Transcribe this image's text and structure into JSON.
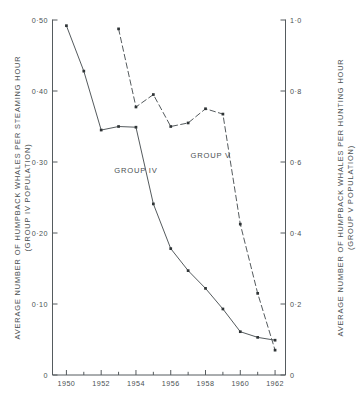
{
  "figure": {
    "background": "#ffffff",
    "ink_color": "#4b5154",
    "marker_color": "#2f3436"
  },
  "axes": {
    "left": {
      "title_line1": "AVERAGE NUMBER OF HUMPBACK WHALES PER STEAMING HOUR",
      "title_line2": "(GROUP IV POPULATION)",
      "ticks": [
        "0",
        "0·10",
        "0·20",
        "0·30",
        "0·40",
        "0·50"
      ],
      "tick_values": [
        0,
        0.1,
        0.2,
        0.3,
        0.4,
        0.5
      ],
      "range": [
        0,
        0.5
      ]
    },
    "right": {
      "title_line1": "AVERAGE NUMBER OF HUMPBACK WHALES PER HUNTING HOUR",
      "title_line2": "(GROUP V POPULATION)",
      "ticks": [
        "0",
        "0·2",
        "0·4",
        "0·6",
        "0·8",
        "1·0"
      ],
      "tick_values": [
        0,
        0.2,
        0.4,
        0.6,
        0.8,
        1.0
      ],
      "range": [
        0,
        1.0
      ]
    },
    "bottom": {
      "ticks": [
        "1950",
        "1952",
        "1954",
        "1956",
        "1958",
        "1960",
        "1962"
      ],
      "tick_values": [
        1950,
        1952,
        1954,
        1956,
        1958,
        1960,
        1962
      ],
      "minor_values": [
        1951,
        1953,
        1955,
        1957,
        1959,
        1961
      ],
      "range": [
        1949.2,
        1962.6
      ],
      "title": ""
    }
  },
  "annotations": [
    {
      "name": "group-iv-label",
      "text": "GROUP IV",
      "x": 1954.0,
      "y_left": 0.285
    },
    {
      "name": "group-v-label",
      "text": "GROUP V",
      "x": 1958.3,
      "y_left": 0.305
    }
  ],
  "chart_data": {
    "type": "line",
    "title": "",
    "xlabel": "",
    "ylabel": "AVERAGE NUMBER OF HUMPBACK WHALES PER STEAMING HOUR (GROUP IV POPULATION)",
    "y2label": "AVERAGE NUMBER OF HUMPBACK WHALES PER HUNTING HOUR (GROUP V POPULATION)",
    "xlim": [
      1949.2,
      1962.6
    ],
    "ylim": [
      0,
      0.5
    ],
    "y2lim": [
      0,
      1.0
    ],
    "grid": false,
    "legend_position": "inline-annotation",
    "series": [
      {
        "name": "GROUP IV",
        "axis": "left",
        "linestyle": "solid",
        "marker": "square",
        "x": [
          1950,
          1951,
          1952,
          1953,
          1954,
          1955,
          1956,
          1957,
          1958,
          1959,
          1960,
          1961,
          1962
        ],
        "values": [
          0.492,
          0.428,
          0.345,
          0.35,
          0.349,
          0.241,
          0.178,
          0.147,
          0.122,
          0.093,
          0.061,
          0.053,
          0.049
        ]
      },
      {
        "name": "GROUP V",
        "axis": "right",
        "linestyle": "dashed",
        "marker": "square",
        "x": [
          1953,
          1954,
          1955,
          1956,
          1957,
          1958,
          1959,
          1960,
          1961,
          1962
        ],
        "values": [
          0.975,
          0.755,
          0.79,
          0.7,
          0.71,
          0.75,
          0.735,
          0.425,
          0.23,
          0.07
        ]
      }
    ]
  }
}
